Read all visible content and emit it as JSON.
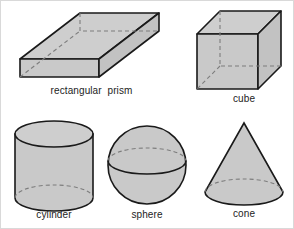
{
  "figure": {
    "background_color": "#ffffff",
    "fill_color": "#c9c9c9",
    "outline_color": "#1a1a1a",
    "hidden_edge_color": "#7d7d7d",
    "label_color": "#232323",
    "width": 294,
    "height": 229
  },
  "shapes": [
    {
      "id": "rectangular-prism",
      "label": "rectangular  prism",
      "row": 1,
      "column": 1,
      "kind": "polyhedron",
      "hidden_edges": "dashed",
      "faces": [
        "top",
        "front",
        "right"
      ]
    },
    {
      "id": "cube",
      "label": "cube",
      "row": 1,
      "column": 2,
      "kind": "polyhedron",
      "hidden_edges": "dashed",
      "faces": [
        "top",
        "front",
        "right"
      ]
    },
    {
      "id": "cylinder",
      "label": "cylinder",
      "row": 2,
      "column": 1,
      "kind": "solid-of-revolution",
      "hidden_edges": "dashed",
      "faces": [
        "top-ellipse",
        "lateral",
        "bottom-ellipse"
      ]
    },
    {
      "id": "sphere",
      "label": "sphere",
      "row": 2,
      "column": 2,
      "kind": "solid-of-revolution",
      "hidden_edges": "dashed",
      "faces": [
        "circle",
        "equator"
      ]
    },
    {
      "id": "cone",
      "label": "cone",
      "row": 2,
      "column": 3,
      "kind": "solid-of-revolution",
      "hidden_edges": "dashed",
      "faces": [
        "lateral",
        "base-ellipse"
      ]
    }
  ]
}
